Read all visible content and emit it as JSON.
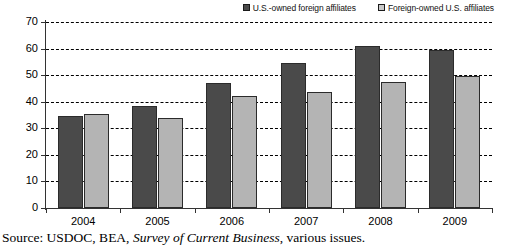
{
  "legend": {
    "entries": [
      {
        "label": "U.S.-owned foreign affiliates",
        "swatch": "dark",
        "color": "#4a4a4a"
      },
      {
        "label": "Foreign-owned U.S. affiliates",
        "swatch": "light",
        "color": "#b4b4b4"
      }
    ]
  },
  "source": {
    "prefix": "Source: USDOC, BEA, ",
    "italic": "Survey of Current Business",
    "suffix": ", various issues."
  },
  "chart_data": {
    "type": "bar",
    "title": "",
    "xlabel": "",
    "ylabel": "",
    "ylim": [
      0,
      70
    ],
    "yticks": [
      0,
      10,
      20,
      30,
      40,
      50,
      60,
      70
    ],
    "grid": true,
    "legend_position": "top-right",
    "categories": [
      "2004",
      "2005",
      "2006",
      "2007",
      "2008",
      "2009"
    ],
    "series": [
      {
        "name": "U.S.-owned foreign affiliates",
        "color": "#4a4a4a",
        "values": [
          34.5,
          38.5,
          47,
          54.5,
          61,
          59.5
        ]
      },
      {
        "name": "Foreign-owned U.S. affiliates",
        "color": "#b4b4b4",
        "values": [
          35.5,
          34,
          42,
          43.5,
          47.5,
          49.5
        ]
      }
    ]
  }
}
